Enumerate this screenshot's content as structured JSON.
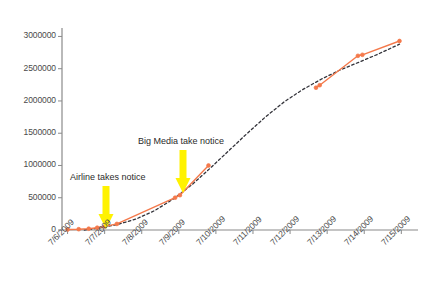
{
  "chart": {
    "title": "Twitter Mentions Over Time",
    "type": "line"
  },
  "chart_data": {
    "type": "line",
    "title": "Twitter Mentions Over Time",
    "subtitle": "",
    "xlabel": "",
    "ylabel": "",
    "x": [
      "7/6/2009",
      "7/7/2009",
      "7/8/2009",
      "7/9/2009",
      "7/10/2009",
      "7/11/2009",
      "7/12/2009",
      "7/13/2009",
      "7/14/2009",
      "7/15/2009"
    ],
    "xtick_labels": [
      "7/6/2009",
      "7/7/2009",
      "7/8/2009",
      "7/9/2009",
      "7/10/2009",
      "7/11/2009",
      "7/12/2009",
      "7/13/2009",
      "7/14/2009",
      "7/15/2009"
    ],
    "ytick_labels": [
      "0",
      "500000",
      "1000000",
      "1500000",
      "2000000",
      "2500000",
      "3000000"
    ],
    "ytick_values": [
      0,
      500000,
      1000000,
      1500000,
      2000000,
      2500000,
      3000000
    ],
    "ylim": [
      0,
      3100000
    ],
    "xlim": [
      0,
      9.6
    ],
    "grid": false,
    "legend": "none",
    "series": [
      {
        "name": "Observed views",
        "color": "#F4794B",
        "marker": "circle",
        "style": "solid",
        "points": [
          {
            "x": 0.15,
            "y": 8000
          },
          {
            "x": 0.45,
            "y": 12000
          },
          {
            "x": 0.72,
            "y": 20000
          },
          {
            "x": 0.95,
            "y": 35000
          },
          {
            "x": 1.15,
            "y": 55000
          },
          {
            "x": 1.48,
            "y": 95000
          },
          {
            "x": 3.05,
            "y": 500000
          },
          {
            "x": 3.18,
            "y": 540000
          },
          {
            "x": 3.95,
            "y": 1000000
          },
          {
            "x": 6.85,
            "y": 2205000
          },
          {
            "x": 6.95,
            "y": 2245000
          },
          {
            "x": 7.98,
            "y": 2700000
          },
          {
            "x": 8.1,
            "y": 2715000
          },
          {
            "x": 9.1,
            "y": 2930000
          }
        ]
      },
      {
        "name": "Trend (fitted)",
        "color": "#33333a",
        "marker": "none",
        "style": "dashed",
        "points": [
          {
            "x": 0.6,
            "y": 0
          },
          {
            "x": 1.0,
            "y": 30000
          },
          {
            "x": 1.5,
            "y": 85000
          },
          {
            "x": 2.0,
            "y": 170000
          },
          {
            "x": 2.5,
            "y": 300000
          },
          {
            "x": 3.0,
            "y": 480000
          },
          {
            "x": 3.5,
            "y": 700000
          },
          {
            "x": 4.0,
            "y": 960000
          },
          {
            "x": 4.5,
            "y": 1230000
          },
          {
            "x": 5.0,
            "y": 1500000
          },
          {
            "x": 5.5,
            "y": 1760000
          },
          {
            "x": 6.0,
            "y": 1990000
          },
          {
            "x": 6.5,
            "y": 2180000
          },
          {
            "x": 7.0,
            "y": 2340000
          },
          {
            "x": 7.5,
            "y": 2480000
          },
          {
            "x": 8.0,
            "y": 2600000
          },
          {
            "x": 8.5,
            "y": 2720000
          },
          {
            "x": 9.1,
            "y": 2880000
          }
        ]
      }
    ],
    "annotations": [
      {
        "id": "airline",
        "label": "Airline takes notice",
        "label_x": 70,
        "label_y": 172,
        "arrow_x": 106,
        "arrow_top": 186,
        "arrow_bottom": 229,
        "arrow_color": "#FFF200"
      },
      {
        "id": "big-media",
        "label": "Big Media take notice",
        "label_x": 138,
        "label_y": 136,
        "arrow_x": 183,
        "arrow_top": 150,
        "arrow_bottom": 193,
        "arrow_color": "#FFF200"
      }
    ]
  },
  "axes": {
    "axis_color": "#8a8a8a",
    "tick_color": "#8a8a8a",
    "plot_left": 62,
    "plot_right": 418,
    "plot_top": 30,
    "plot_bottom": 230
  }
}
